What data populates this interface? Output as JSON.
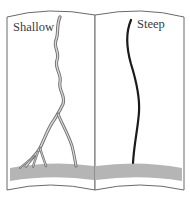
{
  "diagram": {
    "type": "open-book-comparison",
    "panels": [
      {
        "id": "left",
        "label": "Shallow",
        "depiction": "braided branching channel (double-line) widening toward base"
      },
      {
        "id": "right",
        "label": "Steep",
        "depiction": "single narrow dark channel"
      }
    ],
    "colors": {
      "page_outline": "#6a6a6a",
      "ground": "#b5b5b5",
      "channel_outline": "#6e6e6e",
      "channel_fill": "#d8d8d8",
      "steep_channel": "#1a1a1a",
      "label_text": "#3a3a3a"
    }
  }
}
